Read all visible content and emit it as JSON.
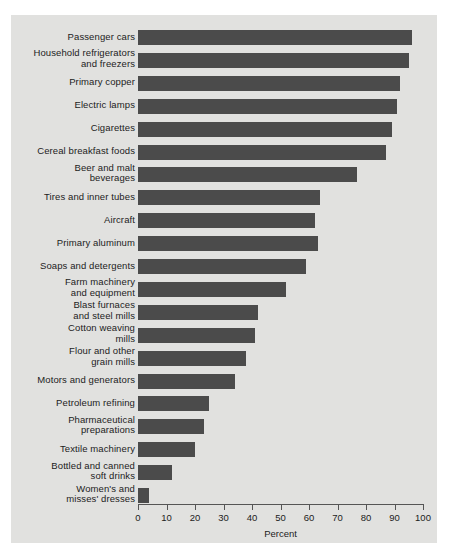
{
  "chart_data": {
    "type": "bar",
    "orientation": "horizontal",
    "title": "",
    "xlabel": "Percent",
    "ylabel": "",
    "xlim": [
      0,
      100
    ],
    "xticks": [
      0,
      10,
      20,
      30,
      40,
      50,
      60,
      70,
      80,
      90,
      100
    ],
    "grid": false,
    "legend": null,
    "bar_color": "#4b4b4b",
    "background_color": "#e1e1df",
    "categories": [
      "Passenger cars",
      "Household refrigerators\nand freezers",
      "Primary copper",
      "Electric lamps",
      "Cigarettes",
      "Cereal breakfast foods",
      "Beer and malt\nbeverages",
      "Tires and inner tubes",
      "Aircraft",
      "Primary aluminum",
      "Soaps and detergents",
      "Farm machinery\nand equipment",
      "Blast furnaces\nand steel mills",
      "Cotton weaving\nmills",
      "Flour and other\ngrain mills",
      "Motors and generators",
      "Petroleum refining",
      "Pharmaceutical\npreparations",
      "Textile machinery",
      "Bottled and canned\nsoft drinks",
      "Women's and\nmisses' dresses"
    ],
    "values": [
      96,
      95,
      92,
      91,
      89,
      87,
      77,
      64,
      62,
      63,
      59,
      52,
      42,
      41,
      38,
      34,
      25,
      23,
      20,
      12,
      4
    ]
  }
}
